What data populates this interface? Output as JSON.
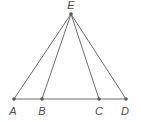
{
  "figure": {
    "type": "geometry-diagram",
    "background_color": "#ffffff",
    "stroke_color": "#6e6e6e",
    "label_color": "#4d4d4d",
    "point_color": "#5a5a5a",
    "stroke_width": 1,
    "point_radius": 1.8,
    "canvas": {
      "width": 141,
      "height": 122
    },
    "points": [
      {
        "id": "E",
        "label": "E",
        "x": 71,
        "y": 14,
        "label_x": 71,
        "label_y": 9,
        "show_dot": true
      },
      {
        "id": "A",
        "label": "A",
        "x": 14,
        "y": 99,
        "label_x": 13,
        "label_y": 115,
        "show_dot": true
      },
      {
        "id": "B",
        "label": "B",
        "x": 42,
        "y": 99,
        "label_x": 42,
        "label_y": 115,
        "show_dot": true
      },
      {
        "id": "C",
        "label": "C",
        "x": 99,
        "y": 99,
        "label_x": 99,
        "label_y": 115,
        "show_dot": true
      },
      {
        "id": "D",
        "label": "D",
        "x": 126,
        "y": 99,
        "label_x": 125,
        "label_y": 115,
        "show_dot": true
      }
    ],
    "segments": [
      {
        "id": "AD",
        "name": "base-line",
        "from": "A",
        "to": "D"
      },
      {
        "id": "EA",
        "name": "segment-e-a",
        "from": "E",
        "to": "A"
      },
      {
        "id": "EB",
        "name": "segment-e-b",
        "from": "E",
        "to": "B"
      },
      {
        "id": "EC",
        "name": "segment-e-c",
        "from": "E",
        "to": "C"
      },
      {
        "id": "ED",
        "name": "segment-e-d",
        "from": "E",
        "to": "D"
      }
    ]
  }
}
